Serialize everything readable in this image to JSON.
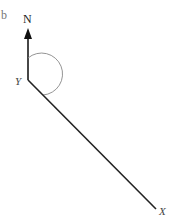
{
  "figure": {
    "part_label": "b",
    "north_label": "N",
    "point_y_label": "Y",
    "point_x_label": "X"
  },
  "colors": {
    "line": "#222222",
    "arc": "#888888",
    "part_label": "#777777"
  }
}
